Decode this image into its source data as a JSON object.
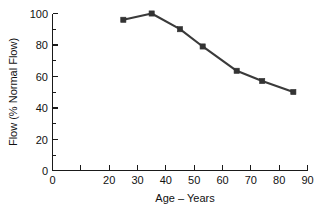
{
  "chart_data": {
    "type": "line",
    "title": "",
    "xlabel": "Age – Years",
    "ylabel": "Flow (% Normal Flow)",
    "xlim": [
      0,
      90
    ],
    "ylim": [
      0,
      100
    ],
    "grid": false,
    "legend": "none",
    "x": [
      25,
      35,
      45,
      53,
      65,
      74,
      85
    ],
    "values": [
      96,
      100,
      90,
      79,
      63.5,
      57,
      50
    ],
    "points": [
      {
        "age": 25,
        "flow": 96
      },
      {
        "age": 35,
        "flow": 100
      },
      {
        "age": 45,
        "flow": 90
      },
      {
        "age": 53,
        "flow": 79
      },
      {
        "age": 65,
        "flow": 63.5
      },
      {
        "age": 74,
        "flow": 57
      },
      {
        "age": 85,
        "flow": 50
      }
    ],
    "xticks": [
      0,
      10,
      20,
      30,
      40,
      50,
      60,
      70,
      80,
      90
    ],
    "xticklabels": [
      "0",
      "",
      "20",
      "30",
      "40",
      "50",
      "60",
      "70",
      "80",
      "90"
    ],
    "yticks": [
      0,
      20,
      40,
      60,
      80,
      100
    ],
    "yticklabels": [
      "0",
      "20",
      "40",
      "60",
      "80",
      "100"
    ],
    "y_minor_ticks": [
      10,
      30,
      50,
      70,
      90
    ],
    "series_color": "#333333",
    "axis_color": "#1a1a1a",
    "background": "#ffffff",
    "marker": "square"
  }
}
